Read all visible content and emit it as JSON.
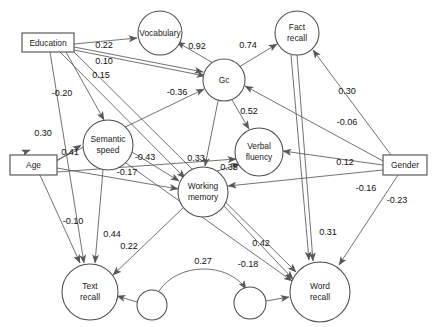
{
  "diagram": {
    "type": "path-diagram",
    "title": "",
    "canvas": {
      "width": 432,
      "height": 327,
      "background": "#ffffff"
    },
    "colors": {
      "node_stroke": "#4d4d4d",
      "box_stroke": "#5a5a5a",
      "edge_stroke": "#58585a",
      "node_fill": "#ffffff",
      "text": "#111111"
    },
    "nodes": [
      {
        "id": "education",
        "label": "Education",
        "shape": "rect",
        "x": 22,
        "y": 33,
        "w": 52,
        "h": 19
      },
      {
        "id": "age",
        "label": "Age",
        "shape": "rect",
        "x": 10,
        "y": 155,
        "w": 47,
        "h": 20
      },
      {
        "id": "gender",
        "label": "Gender",
        "shape": "rect",
        "x": 383,
        "y": 155,
        "w": 44,
        "h": 20
      },
      {
        "id": "vocabulary",
        "label": "Vocabulary",
        "shape": "circle",
        "cx": 160,
        "cy": 33,
        "r": 22
      },
      {
        "id": "factrecall",
        "label": "Fact recall",
        "shape": "circle",
        "cx": 297,
        "cy": 33,
        "r": 22,
        "lines": [
          "Fact",
          "recall"
        ]
      },
      {
        "id": "gc",
        "label": "Gc",
        "shape": "circle",
        "cx": 224,
        "cy": 80,
        "r": 21
      },
      {
        "id": "semanticspeed",
        "label": "Semantic speed",
        "shape": "circle",
        "cx": 108,
        "cy": 145,
        "r": 25,
        "lines": [
          "Semantic",
          "speed"
        ]
      },
      {
        "id": "verbalfluency",
        "label": "Verbal fluency",
        "shape": "circle",
        "cx": 259,
        "cy": 152,
        "r": 24,
        "lines": [
          "Verbal",
          "fluency"
        ]
      },
      {
        "id": "workingmemory",
        "label": "Working memory",
        "shape": "circle",
        "cx": 203,
        "cy": 192,
        "r": 25,
        "lines": [
          "Working",
          "memory"
        ]
      },
      {
        "id": "textrecall",
        "label": "Text recall",
        "shape": "circle",
        "cx": 90,
        "cy": 292,
        "r": 28,
        "lines": [
          "Text",
          "recall"
        ]
      },
      {
        "id": "wordrecall",
        "label": "Word recall",
        "shape": "circle",
        "cx": 320,
        "cy": 292,
        "r": 30,
        "lines": [
          "Word",
          "recall"
        ]
      },
      {
        "id": "resid1",
        "label": "",
        "shape": "circle",
        "cx": 152,
        "cy": 305,
        "r": 15
      },
      {
        "id": "resid2",
        "label": "",
        "shape": "circle",
        "cx": 250,
        "cy": 303,
        "r": 16
      }
    ],
    "edges": [
      {
        "id": "edu-voc",
        "from": "education",
        "to": "vocabulary",
        "coefficient": "0.22",
        "label_x": 104,
        "label_y": 46
      },
      {
        "id": "edu-gc",
        "from": "education",
        "to": "gc",
        "coefficient": "0.10",
        "label_x": 104,
        "label_y": 62
      },
      {
        "id": "edu-sem",
        "from": "education",
        "to": "semanticspeed",
        "coefficient": "0.15",
        "label_x": 101,
        "label_y": 76
      },
      {
        "id": "edu-wm",
        "from": "education",
        "to": "workingmemory",
        "coefficient": "-0.20",
        "label_x": 62,
        "label_y": 94
      },
      {
        "id": "edu-txt",
        "from": "education",
        "to": "textrecall",
        "coefficient": "",
        "label_x": 0,
        "label_y": 0
      },
      {
        "id": "edu-word",
        "from": "education",
        "to": "wordrecall",
        "coefficient": "",
        "label_x": 0,
        "label_y": 0
      },
      {
        "id": "voc-gc",
        "from": "vocabulary",
        "to": "gc",
        "coefficient": "0.92",
        "label_x": 197,
        "label_y": 47
      },
      {
        "id": "gc-fact",
        "from": "gc",
        "to": "factrecall",
        "coefficient": "0.74",
        "label_x": 248,
        "label_y": 46
      },
      {
        "id": "gc-verb",
        "from": "gc",
        "to": "verbalfluency",
        "coefficient": "0.52",
        "label_x": 249,
        "label_y": 112
      },
      {
        "id": "gc-wm",
        "from": "gc",
        "to": "workingmemory",
        "coefficient": "0.33",
        "label_x": 196,
        "label_y": 159
      },
      {
        "id": "wm-verb",
        "from": "workingmemory",
        "to": "verbalfluency",
        "coefficient": "0.35",
        "label_x": 229,
        "label_y": 168
      },
      {
        "id": "age-gc",
        "from": "age",
        "to": "gc",
        "coefficient": "-0.36",
        "label_x": 177,
        "label_y": 93
      },
      {
        "id": "age-sem",
        "from": "age",
        "to": "semanticspeed",
        "coefficient": "0.41",
        "label_x": 70,
        "label_y": 153
      },
      {
        "id": "edu2-sem",
        "from": "education",
        "to": "semanticspeed",
        "coefficient": "0.30",
        "label_x": 43,
        "label_y": 134
      },
      {
        "id": "sem-wm",
        "from": "semanticspeed",
        "to": "workingmemory",
        "coefficient": "-0.43",
        "label_x": 145,
        "label_y": 158
      },
      {
        "id": "age-wm",
        "from": "age",
        "to": "workingmemory",
        "coefficient": "-0.17",
        "label_x": 127,
        "label_y": 173
      },
      {
        "id": "age-txt",
        "from": "age",
        "to": "textrecall",
        "coefficient": "-0.10",
        "label_x": 73,
        "label_y": 222
      },
      {
        "id": "sem-txt",
        "from": "semanticspeed",
        "to": "textrecall",
        "coefficient": "0.44",
        "label_x": 112,
        "label_y": 235
      },
      {
        "id": "wm-txt",
        "from": "workingmemory",
        "to": "textrecall",
        "coefficient": "0.22",
        "label_x": 129,
        "label_y": 247
      },
      {
        "id": "wm-word",
        "from": "workingmemory",
        "to": "wordrecall",
        "coefficient": "0.42",
        "label_x": 261,
        "label_y": 244
      },
      {
        "id": "gc-word",
        "from": "gc",
        "to": "wordrecall",
        "coefficient": "0.31",
        "label_x": 328,
        "label_y": 233
      },
      {
        "id": "fact-gend",
        "from": "gender",
        "to": "factrecall",
        "coefficient": "0.30",
        "label_x": 347,
        "label_y": 92
      },
      {
        "id": "gend-gc",
        "from": "gender",
        "to": "gc",
        "coefficient": "-0.06",
        "label_x": 347,
        "label_y": 123
      },
      {
        "id": "gend-verb",
        "from": "gender",
        "to": "verbalfluency",
        "coefficient": "0.12",
        "label_x": 345,
        "label_y": 163
      },
      {
        "id": "gend-wm",
        "from": "gender",
        "to": "workingmemory",
        "coefficient": "-0.16",
        "label_x": 366,
        "label_y": 189
      },
      {
        "id": "gend-word",
        "from": "gender",
        "to": "wordrecall",
        "coefficient": "-0.23",
        "label_x": 397,
        "label_y": 201
      },
      {
        "id": "sem-word",
        "from": "semanticspeed",
        "to": "wordrecall",
        "coefficient": "-0.18",
        "label_x": 248,
        "label_y": 265
      },
      {
        "id": "res-corr",
        "from": "resid1",
        "to": "resid2",
        "coefficient": "0.27",
        "label_x": 203,
        "label_y": 262
      },
      {
        "id": "res1-txt",
        "from": "resid1",
        "to": "textrecall",
        "coefficient": "",
        "label_x": 0,
        "label_y": 0
      },
      {
        "id": "res2-word",
        "from": "resid2",
        "to": "wordrecall",
        "coefficient": "",
        "label_x": 0,
        "label_y": 0
      }
    ],
    "coefficient_labels": [
      "0.22",
      "0.10",
      "0.15",
      "-0.20",
      "0.92",
      "0.74",
      "0.30",
      "-0.36",
      "0.52",
      "-0.06",
      "0.30",
      "0.41",
      "-0.43",
      "0.33",
      "0.35",
      "0.12",
      "-0.17",
      "-0.16",
      "-0.23",
      "-0.10",
      "0.44",
      "0.22",
      "0.42",
      "0.31",
      "-0.18",
      "0.27"
    ]
  }
}
